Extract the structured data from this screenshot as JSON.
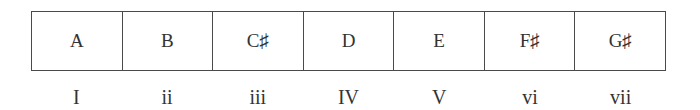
{
  "scale": {
    "notes": [
      {
        "label": "A"
      },
      {
        "label": "B"
      },
      {
        "label": "C♯"
      },
      {
        "label": "D"
      },
      {
        "label": "E"
      },
      {
        "label": "F♯"
      },
      {
        "label": "G♯"
      }
    ],
    "degrees": [
      {
        "label": "I"
      },
      {
        "label": "ii"
      },
      {
        "label": "iii"
      },
      {
        "label": "IV"
      },
      {
        "label": "V"
      },
      {
        "label": "vi"
      },
      {
        "label": "vii"
      }
    ]
  }
}
